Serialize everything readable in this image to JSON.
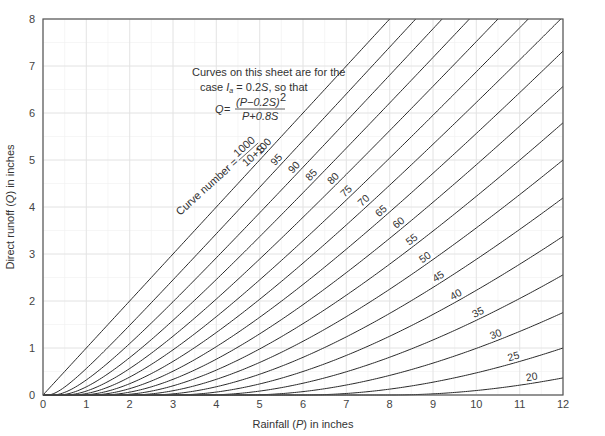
{
  "chart_data": {
    "type": "line",
    "title": "",
    "xlabel": "Rainfall (P) in inches",
    "ylabel": "Direct runoff (Q) in inches",
    "xlim": [
      0,
      12
    ],
    "ylim": [
      0,
      8
    ],
    "x_ticks": [
      0,
      1,
      2,
      3,
      4,
      5,
      6,
      7,
      8,
      9,
      10,
      11,
      12
    ],
    "y_ticks": [
      0,
      1,
      2,
      3,
      4,
      5,
      6,
      7,
      8
    ],
    "grid": true,
    "minor_grid": true,
    "equation": "Q = (P - 0.2S)^2 / (P + 0.8S)",
    "annotation_lines": [
      "Curves on this sheet are for the",
      "case Ia = 0.2S, so that"
    ],
    "curve_number_definition": "Curve number = 1000 / (10 + S)",
    "series_names": [
      "100",
      "95",
      "90",
      "85",
      "80",
      "75",
      "70",
      "65",
      "60",
      "55",
      "50",
      "45",
      "40",
      "35",
      "30",
      "25",
      "20"
    ],
    "curve_numbers": [
      100,
      95,
      90,
      85,
      80,
      75,
      70,
      65,
      60,
      55,
      50,
      45,
      40,
      35,
      30,
      25,
      20
    ],
    "series": [
      {
        "name": "CN 100",
        "x": [
          0,
          2,
          4,
          6,
          8
        ],
        "values": [
          0,
          2,
          4,
          6,
          8
        ]
      },
      {
        "name": "CN 95",
        "x": [
          0,
          2,
          4,
          6,
          8
        ],
        "values": [
          0,
          1.56,
          3.48,
          5.45,
          7.43
        ]
      },
      {
        "name": "CN 90",
        "x": [
          0,
          2,
          4,
          6,
          8
        ],
        "values": [
          0,
          1.09,
          2.98,
          4.92,
          6.89
        ]
      },
      {
        "name": "CN 85",
        "x": [
          0,
          2,
          4,
          6,
          8,
          10
        ],
        "values": [
          0,
          0.76,
          2.54,
          4.45,
          6.39,
          8.35
        ]
      },
      {
        "name": "CN 80",
        "x": [
          0,
          2,
          4,
          6,
          8,
          10
        ],
        "values": [
          0,
          0.56,
          2.04,
          3.78,
          5.62,
          7.51
        ]
      },
      {
        "name": "CN 75",
        "x": [
          0,
          2,
          4,
          6,
          8,
          10
        ],
        "values": [
          0,
          0.38,
          1.67,
          3.28,
          5.04,
          6.87
        ]
      },
      {
        "name": "CN 70",
        "x": [
          0,
          2,
          4,
          6,
          8,
          10,
          12
        ],
        "values": [
          0,
          0.17,
          1.08,
          2.53,
          4.16,
          5.92,
          7.72
        ]
      },
      {
        "name": "CN 65",
        "x": [
          0,
          2,
          4,
          6,
          8,
          10,
          12
        ],
        "values": [
          0,
          0.08,
          0.79,
          2.06,
          3.57,
          5.22,
          6.94
        ]
      },
      {
        "name": "CN 60",
        "x": [
          0,
          2,
          4,
          6,
          8,
          10,
          12
        ],
        "values": [
          0,
          0.02,
          0.56,
          1.65,
          3.0,
          4.55,
          6.18
        ]
      },
      {
        "name": "CN 55",
        "x": [
          0,
          2,
          4,
          6,
          8,
          10,
          12
        ],
        "values": [
          0,
          0.0,
          0.37,
          1.28,
          2.52,
          3.95,
          5.49
        ]
      },
      {
        "name": "CN 50",
        "x": [
          0,
          2,
          4,
          6,
          8,
          10,
          12
        ],
        "values": [
          0,
          0.0,
          0.22,
          0.96,
          2.04,
          3.34,
          4.77
        ]
      },
      {
        "name": "CN 45",
        "x": [
          0,
          4,
          6,
          8,
          10,
          12
        ],
        "values": [
          0,
          0.12,
          0.68,
          1.6,
          2.78,
          4.11
        ]
      },
      {
        "name": "CN 40",
        "x": [
          0,
          4,
          6,
          8,
          10,
          12
        ],
        "values": [
          0,
          0.04,
          0.43,
          1.19,
          2.23,
          3.45
        ]
      },
      {
        "name": "CN 35",
        "x": [
          0,
          4,
          6,
          8,
          10,
          12
        ],
        "values": [
          0,
          0.0,
          0.22,
          0.8,
          1.69,
          2.79
        ]
      },
      {
        "name": "CN 30",
        "x": [
          0,
          6,
          8,
          10,
          12
        ],
        "values": [
          0,
          0.07,
          0.46,
          1.16,
          2.11
        ]
      },
      {
        "name": "CN 25",
        "x": [
          0,
          6,
          8,
          10,
          12
        ],
        "values": [
          0,
          0.0,
          0.17,
          0.63,
          1.37
        ]
      },
      {
        "name": "CN 20",
        "x": [
          0,
          8,
          10,
          12
        ],
        "values": [
          0,
          0.0,
          0.13,
          0.56
        ]
      }
    ],
    "label_positions": [
      {
        "cn": "100",
        "p": 5.2
      },
      {
        "cn": "95",
        "p": 5.5
      },
      {
        "cn": "90",
        "p": 5.9
      },
      {
        "cn": "85",
        "p": 6.3
      },
      {
        "cn": "80",
        "p": 6.8
      },
      {
        "cn": "75",
        "p": 7.1
      },
      {
        "cn": "70",
        "p": 7.5
      },
      {
        "cn": "65",
        "p": 7.9
      },
      {
        "cn": "60",
        "p": 8.3
      },
      {
        "cn": "55",
        "p": 8.6
      },
      {
        "cn": "50",
        "p": 8.9
      },
      {
        "cn": "45",
        "p": 9.2
      },
      {
        "cn": "40",
        "p": 9.6
      },
      {
        "cn": "35",
        "p": 10.1
      },
      {
        "cn": "30",
        "p": 10.5
      },
      {
        "cn": "25",
        "p": 10.9
      },
      {
        "cn": "20",
        "p": 11.3
      }
    ]
  },
  "labels": {
    "note_line1": "Curves on this sheet are for the",
    "note_line2_pre": "case ",
    "note_line2_Ia": "I",
    "note_line2_a": "a",
    "note_line2_post": " = 0.2",
    "note_line2_S": "S",
    "note_line2_end": ", so that",
    "eq_Q": "Q",
    "eq_eq": " = ",
    "eq_num": "(P−0.2S)",
    "eq_sup": "2",
    "eq_den": "P+0.8S",
    "cn_def_text": "Curve number = ",
    "cn_def_num": "1000",
    "cn_def_den": "10+S",
    "xlabel_pre": "Rainfall (",
    "xlabel_var": "P",
    "xlabel_post": ") in inches",
    "ylabel_pre": "Direct runoff (",
    "ylabel_var": "Q",
    "ylabel_post": ") in inches"
  }
}
